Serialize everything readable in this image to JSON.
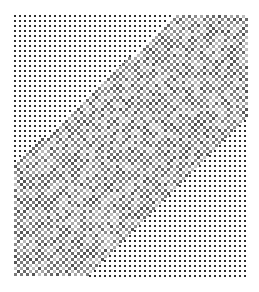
{
  "image": {
    "description": "halftone dot pattern with diagonal lighter checkerboard band",
    "background": "#ffffff",
    "pattern_area": {
      "x": 14,
      "y": 15,
      "width": 232,
      "height": 261
    },
    "coarse_grid": {
      "pitch": 5,
      "dot_size": 2,
      "color": "#2e2e2e"
    },
    "band": {
      "upper_edge": [
        [
          14,
          165
        ],
        [
          175,
          15
        ]
      ],
      "lower_edge": [
        [
          90,
          276
        ],
        [
          246,
          120
        ]
      ],
      "checker_pitch": 3,
      "colors": [
        "#6a6a6a",
        "#8c8c8c",
        "#a8a8a8",
        "#7a7a7a",
        "#bcbcbc",
        "#555555"
      ]
    }
  }
}
